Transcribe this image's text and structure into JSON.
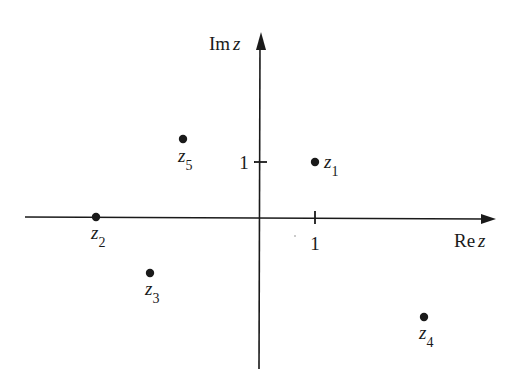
{
  "diagram": {
    "type": "complex-plane",
    "axes": {
      "real_label": {
        "prefix": "Re",
        "var": "z"
      },
      "imag_label": {
        "prefix": "Im",
        "var": "z"
      },
      "real_tick_label": "1",
      "imag_tick_label": "1"
    },
    "points": [
      {
        "name": "z",
        "sub": "1",
        "re": 1,
        "im": 1
      },
      {
        "name": "z",
        "sub": "2",
        "re": -3,
        "im": 0
      },
      {
        "name": "z",
        "sub": "3",
        "re": -2,
        "im": -1
      },
      {
        "name": "z",
        "sub": "4",
        "re": 3,
        "im": -1.8
      },
      {
        "name": "z",
        "sub": "5",
        "re": -1.4,
        "im": 1.4
      }
    ]
  },
  "colors": {
    "ink": "#1a1a1a",
    "background": "#ffffff"
  }
}
